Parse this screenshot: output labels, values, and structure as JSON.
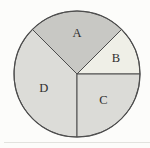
{
  "figure": {
    "background": "#fcfcfa",
    "outline_color": "#4d4d4d",
    "label_color": "#2e2e2e"
  },
  "chart_data": {
    "type": "pie",
    "title": "",
    "legend": "none",
    "direction": "counterclockwise",
    "start_angle_deg": 0,
    "center": {
      "x": 77,
      "y": 74
    },
    "radius": 63,
    "slices": [
      {
        "label": "B",
        "angle_deg": 45,
        "percent": 12.5,
        "color": "#efefe7",
        "label_r_frac": 0.67
      },
      {
        "label": "A",
        "angle_deg": 90,
        "percent": 25,
        "color": "#c8c8c4",
        "label_r_frac": 0.65
      },
      {
        "label": "D",
        "angle_deg": 135,
        "percent": 37.5,
        "color": "#dcdcd8",
        "label_r_frac": 0.57
      },
      {
        "label": "C",
        "angle_deg": 90,
        "percent": 25,
        "color": "#dbdbd7",
        "label_r_frac": 0.59
      }
    ]
  }
}
